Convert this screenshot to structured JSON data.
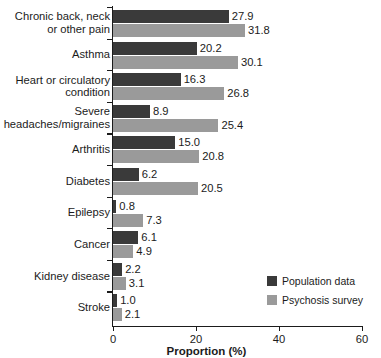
{
  "chart_data": {
    "type": "bar",
    "orientation": "horizontal",
    "title": "",
    "xlabel": "Proportion (%)",
    "ylabel": "",
    "xlim": [
      0,
      60
    ],
    "xticks": [
      "0",
      "20",
      "40",
      "60"
    ],
    "grid": false,
    "legend_position": "inside-lower-right",
    "categories": [
      "Chronic back, neck\nor other pain",
      "Asthma",
      "Heart or circulatory\ncondition",
      "Severe\nheadaches/migraines",
      "Arthritis",
      "Diabetes",
      "Epilepsy",
      "Cancer",
      "Kidney disease",
      "Stroke"
    ],
    "series": [
      {
        "name": "Population data",
        "color": "#3a3a3a",
        "values": [
          27.9,
          20.2,
          16.3,
          8.9,
          15.0,
          6.2,
          0.8,
          6.1,
          2.2,
          1.0
        ],
        "labels": [
          "27.9",
          "20.2",
          "16.3",
          "8.9",
          "15.0",
          "6.2",
          "0.8",
          "6.1",
          "2.2",
          "1.0"
        ]
      },
      {
        "name": "Psychosis survey",
        "color": "#9a9a9a",
        "values": [
          31.8,
          30.1,
          26.8,
          25.4,
          20.8,
          20.5,
          7.3,
          4.9,
          3.1,
          2.1
        ],
        "labels": [
          "31.8",
          "30.1",
          "26.8",
          "25.4",
          "20.8",
          "20.5",
          "7.3",
          "4.9",
          "3.1",
          "2.1"
        ]
      }
    ]
  },
  "legend": {
    "items": [
      {
        "label": "Population data",
        "color": "#3a3a3a"
      },
      {
        "label": "Psychosis survey",
        "color": "#9a9a9a"
      }
    ]
  }
}
